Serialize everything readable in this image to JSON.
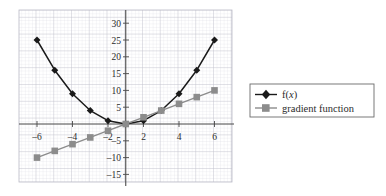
{
  "chart_data": {
    "type": "line",
    "title": "",
    "subtitle": "",
    "xlabel": "",
    "ylabel": "",
    "xlim": [
      -6.4,
      6.4
    ],
    "ylim": [
      -16,
      31
    ],
    "grid": true,
    "grid_major_step_x": 2,
    "grid_major_step_y": 5,
    "grid_minor_subdivisions": 5,
    "legend_position": "right",
    "x": [
      -5,
      -4,
      -3,
      -2,
      -1,
      0,
      1,
      2,
      3,
      4,
      5
    ],
    "series": [
      {
        "name": "f(x)",
        "marker": "diamond",
        "color": "#1a1a1a",
        "values": [
          25,
          16,
          9,
          4,
          1,
          0,
          1,
          4,
          9,
          16,
          25
        ]
      },
      {
        "name": "gradient function",
        "marker": "square",
        "color": "#8c8c8c",
        "values": [
          -10,
          -8,
          -6,
          -4,
          -2,
          0,
          2,
          4,
          6,
          8,
          10
        ]
      }
    ],
    "xticks": [
      -6,
      -4,
      -2,
      2,
      4,
      6
    ],
    "xtick_labels": [
      "–6",
      "–4",
      "–2",
      "2",
      "4",
      "6"
    ],
    "yticks": [
      -15,
      -10,
      -5,
      5,
      10,
      15,
      20,
      25,
      30
    ],
    "ytick_labels": [
      "–15",
      "–10",
      "–5",
      "5",
      "10",
      "15",
      "20",
      "25",
      "30"
    ]
  },
  "legend": {
    "entries": [
      {
        "label_prefix": "f(",
        "label_italic": "x",
        "label_suffix": ")",
        "marker": "diamond-marker",
        "color": "#1a1a1a"
      },
      {
        "label_prefix": "gradient function",
        "label_italic": "",
        "label_suffix": "",
        "marker": "square-marker",
        "color": "#8c8c8c"
      }
    ]
  },
  "colors": {
    "grid_minor": "#d8d8e0",
    "grid_major": "#b6b6c2",
    "axis": "#4a4a4a",
    "series_primary": "#1a1a1a",
    "series_secondary": "#8c8c8c",
    "legend_border": "#6b6b6b",
    "background": "#ffffff"
  }
}
